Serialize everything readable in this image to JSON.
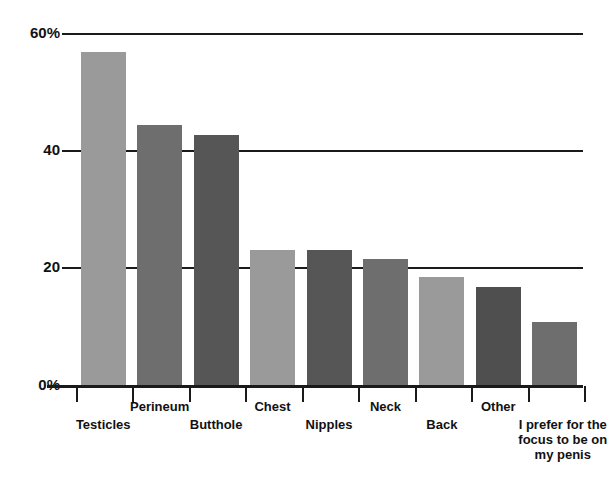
{
  "chart_data": {
    "type": "bar",
    "title": "",
    "subtitle": "",
    "xlabel": "",
    "ylabel": "",
    "ylim": [
      0,
      60
    ],
    "grid": true,
    "legend": "none",
    "y_ticks": [
      {
        "value": 60,
        "label": "60%"
      },
      {
        "value": 40,
        "label": "40"
      },
      {
        "value": 20,
        "label": "20"
      },
      {
        "value": 0,
        "label": "0%"
      }
    ],
    "categories": [
      "Testicles",
      "Perineum",
      "Butthole",
      "Chest",
      "Nipples",
      "Neck",
      "Back",
      "Other",
      "I prefer for the\nfocus to be on\nmy penis"
    ],
    "values": [
      56.8,
      44.4,
      42.7,
      23.0,
      23.0,
      21.4,
      18.4,
      16.7,
      10.7
    ],
    "bar_colors": [
      "#9a9a9a",
      "#6e6e6e",
      "#565656",
      "#9a9a9a",
      "#565656",
      "#6e6e6e",
      "#9a9a9a",
      "#4f4f4f",
      "#6e6e6e"
    ],
    "label_rows": [
      1,
      0,
      1,
      0,
      1,
      0,
      1,
      0,
      1
    ],
    "axis_color": "#1a1a1a",
    "background": "#ffffff"
  }
}
